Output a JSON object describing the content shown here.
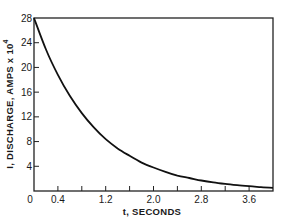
{
  "chart_data": {
    "type": "line",
    "title": "",
    "xlabel": "t, SECONDS",
    "ylabel": "I, DISCHARGE, AMPS x 10",
    "ylabel_superscript": "4",
    "xlim": [
      0,
      4.0
    ],
    "ylim": [
      0,
      28
    ],
    "grid": false,
    "legend": null,
    "x_ticks": [
      0,
      0.4,
      0.8,
      1.2,
      1.6,
      2.0,
      2.4,
      2.8,
      3.2,
      3.6
    ],
    "x_tick_labels": [
      {
        "value": 0,
        "label": "0"
      },
      {
        "value": 0.4,
        "label": "0.4"
      },
      {
        "value": 1.2,
        "label": "1.2"
      },
      {
        "value": 2.0,
        "label": "2.0"
      },
      {
        "value": 2.8,
        "label": "2.8"
      },
      {
        "value": 3.6,
        "label": "3.6"
      }
    ],
    "y_ticks": [
      0,
      4,
      8,
      12,
      16,
      20,
      24,
      28
    ],
    "y_tick_labels": [
      "0",
      "4",
      "8",
      "12",
      "16",
      "20",
      "24",
      "28"
    ],
    "series": [
      {
        "name": "Discharge current",
        "x": [
          0,
          0.2,
          0.4,
          0.6,
          0.8,
          1.0,
          1.2,
          1.4,
          1.6,
          1.8,
          2.0,
          2.2,
          2.4,
          2.6,
          2.8,
          3.0,
          3.2,
          3.4,
          3.6,
          3.8,
          4.0
        ],
        "y": [
          28.0,
          22.9,
          18.8,
          15.4,
          12.6,
          10.3,
          8.4,
          6.9,
          5.7,
          4.6,
          3.8,
          3.1,
          2.5,
          2.1,
          1.7,
          1.4,
          1.15,
          0.94,
          0.77,
          0.63,
          0.51
        ]
      }
    ]
  }
}
